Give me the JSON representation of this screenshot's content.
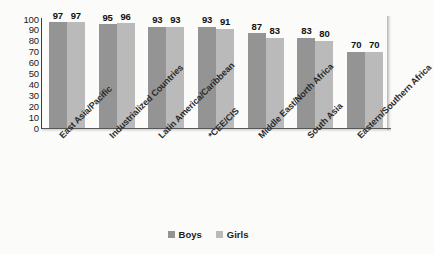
{
  "chart_data": {
    "type": "bar",
    "title": "",
    "subtitle": "",
    "xlabel": "",
    "ylabel": "",
    "ylim": [
      0,
      100
    ],
    "yticks": [
      100,
      90,
      80,
      70,
      60,
      50,
      40,
      30,
      20,
      10,
      0
    ],
    "grid": false,
    "legend_position": "bottom-center",
    "orientation": "vertical",
    "grouping": "grouped",
    "categories": [
      "East Asia/Pacific",
      "Industrialized Countries",
      "Latin America/Caribbean",
      "*CEE/CIS",
      "Middle East/North Africa",
      "South Asia",
      "Eastern/Southern Africa"
    ],
    "series": [
      {
        "name": "Boys",
        "color": "#949494",
        "values": [
          97,
          95,
          93,
          93,
          87,
          83,
          70
        ]
      },
      {
        "name": "Girls",
        "color": "#bababa",
        "values": [
          97,
          96,
          93,
          91,
          83,
          80,
          70
        ]
      }
    ],
    "data_labels": [
      [
        "97",
        "97"
      ],
      [
        "95",
        "96"
      ],
      [
        "93",
        "93"
      ],
      [
        "93",
        "91"
      ],
      [
        "87",
        "83"
      ],
      [
        "83",
        "80"
      ],
      [
        "70",
        "70"
      ]
    ]
  },
  "legend": {
    "items": [
      {
        "label": "Boys",
        "color": "#949494"
      },
      {
        "label": "Girls",
        "color": "#bababa"
      }
    ]
  },
  "axis": {
    "y_ticks": [
      "100",
      "90",
      "80",
      "70",
      "60",
      "50",
      "40",
      "30",
      "20",
      "10",
      "0"
    ]
  }
}
